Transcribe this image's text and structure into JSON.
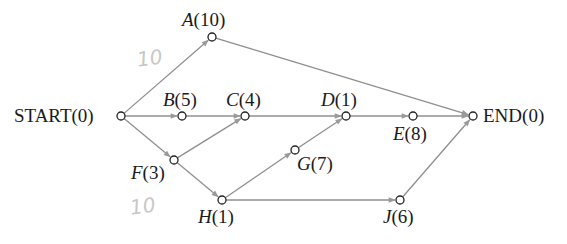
{
  "diagram": {
    "type": "activity-network",
    "nodes": [
      {
        "id": "START",
        "name": "START",
        "duration": "0",
        "x": 121,
        "y": 116
      },
      {
        "id": "A",
        "name": "A",
        "duration": "10",
        "x": 212,
        "y": 37
      },
      {
        "id": "B",
        "name": "B",
        "duration": "5",
        "x": 182,
        "y": 116
      },
      {
        "id": "C",
        "name": "C",
        "duration": "4",
        "x": 245,
        "y": 116
      },
      {
        "id": "D",
        "name": "D",
        "duration": "1",
        "x": 346,
        "y": 116
      },
      {
        "id": "E",
        "name": "E",
        "duration": "8",
        "x": 413,
        "y": 116
      },
      {
        "id": "F",
        "name": "F",
        "duration": "3",
        "x": 174,
        "y": 160
      },
      {
        "id": "G",
        "name": "G",
        "duration": "7",
        "x": 295,
        "y": 150
      },
      {
        "id": "H",
        "name": "H",
        "duration": "1",
        "x": 222,
        "y": 200
      },
      {
        "id": "J",
        "name": "J",
        "duration": "6",
        "x": 400,
        "y": 200
      },
      {
        "id": "END",
        "name": "END",
        "duration": "0",
        "x": 473,
        "y": 116
      }
    ],
    "edges": [
      [
        "START",
        "A"
      ],
      [
        "START",
        "B"
      ],
      [
        "START",
        "F"
      ],
      [
        "A",
        "END"
      ],
      [
        "B",
        "C"
      ],
      [
        "F",
        "C"
      ],
      [
        "F",
        "H"
      ],
      [
        "C",
        "D"
      ],
      [
        "H",
        "G"
      ],
      [
        "G",
        "D"
      ],
      [
        "H",
        "J"
      ],
      [
        "D",
        "E"
      ],
      [
        "E",
        "END"
      ],
      [
        "J",
        "END"
      ]
    ],
    "labels": {
      "START": {
        "text": "START(0)"
      },
      "A": {
        "letter": "A",
        "value": "(10)"
      },
      "B": {
        "letter": "B",
        "value": "(5)"
      },
      "C": {
        "letter": "C",
        "value": "(4)"
      },
      "D": {
        "letter": "D",
        "value": "(1)"
      },
      "E": {
        "letter": "E",
        "value": "(8)"
      },
      "F": {
        "letter": "F",
        "value": "(3)"
      },
      "G": {
        "letter": "G",
        "value": "(7)"
      },
      "H": {
        "letter": "H",
        "value": "(1)"
      },
      "J": {
        "letter": "J",
        "value": "(6)"
      },
      "END": {
        "text": "END(0)"
      }
    },
    "handwritten_notes": [
      {
        "text": "10",
        "near": "START-A edge"
      },
      {
        "text": "10",
        "near": "F/H"
      }
    ]
  }
}
